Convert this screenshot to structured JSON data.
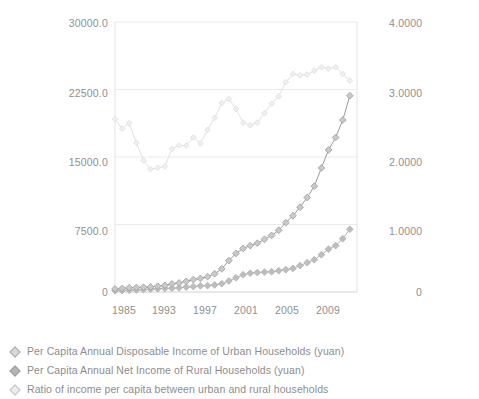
{
  "chart_data": {
    "type": "line",
    "title": "",
    "subtitle": "",
    "xlabel": "",
    "ylabel": "",
    "y2label": "",
    "grid": true,
    "legend_position": "bottom-left",
    "xlim": [
      1978,
      2012
    ],
    "ylim": [
      0,
      30000
    ],
    "y2lim": [
      0,
      4
    ],
    "x_tick_labels": [
      "1985",
      "1993",
      "1997",
      "2001",
      "2005",
      "2009"
    ],
    "x_tick_values": [
      1985,
      1993,
      1997,
      2001,
      2005,
      2009
    ],
    "y_tick_labels": [
      "30000.0",
      "22500.0",
      "15000.0",
      "7500.0",
      "0"
    ],
    "y_tick_values": [
      30000,
      22500,
      15000,
      7500,
      0
    ],
    "y2_tick_labels": [
      "4.0000",
      "3.0000",
      "2.0000",
      "1.0000",
      "0"
    ],
    "y2_tick_values": [
      4,
      3,
      2,
      1,
      0
    ],
    "x": [
      1978,
      1979,
      1980,
      1981,
      1982,
      1983,
      1984,
      1985,
      1986,
      1987,
      1988,
      1989,
      1990,
      1991,
      1992,
      1993,
      1994,
      1995,
      1996,
      1997,
      1998,
      1999,
      2000,
      2001,
      2002,
      2003,
      2004,
      2005,
      2006,
      2007,
      2008,
      2009,
      2010,
      2011
    ],
    "series": [
      {
        "name": "Per Capita Annual Disposable Income of Urban Households (yuan)",
        "axis": "left",
        "color": "#9a9a9a",
        "marker": "diamond",
        "values": [
          343,
          387,
          478,
          492,
          527,
          564,
          652,
          739,
          900,
          1002,
          1181,
          1376,
          1510,
          1701,
          2027,
          2577,
          3496,
          4283,
          4839,
          5160,
          5425,
          5854,
          6280,
          6860,
          7703,
          8472,
          9422,
          10493,
          11760,
          13786,
          15781,
          17175,
          19109,
          21810
        ]
      },
      {
        "name": "Per Capita Annual Net Income of Rural Households (yuan)",
        "axis": "left",
        "color": "#b0b0b0",
        "marker": "diamond",
        "values": [
          134,
          160,
          191,
          223,
          270,
          310,
          355,
          398,
          424,
          463,
          545,
          602,
          686,
          709,
          784,
          922,
          1221,
          1578,
          1926,
          2090,
          2162,
          2210,
          2253,
          2366,
          2476,
          2622,
          2936,
          3255,
          3587,
          4140,
          4761,
          5153,
          5919,
          6977
        ]
      },
      {
        "name": "Ratio of income per capita between urban and rural households",
        "axis": "right",
        "color": "#dcdcdc",
        "marker": "triangle",
        "values": [
          2.56,
          2.42,
          2.5,
          2.21,
          1.95,
          1.82,
          1.84,
          1.86,
          2.12,
          2.17,
          2.17,
          2.29,
          2.2,
          2.4,
          2.58,
          2.8,
          2.86,
          2.71,
          2.51,
          2.47,
          2.51,
          2.65,
          2.79,
          2.9,
          3.11,
          3.23,
          3.21,
          3.22,
          3.28,
          3.33,
          3.31,
          3.33,
          3.23,
          3.13
        ]
      }
    ]
  },
  "legend": {
    "items": [
      {
        "label": "Per Capita Annual Disposable Income of Urban Households (yuan)",
        "marker": "diamond-marker"
      },
      {
        "label": "Per Capita Annual Net Income of Rural Households (yuan)",
        "marker": "diamond-marker"
      },
      {
        "label": "Ratio of income per capita between urban and rural households",
        "marker": "diamond-marker"
      }
    ]
  },
  "axes": {
    "left_ticks": [
      "30000.0",
      "22500.0",
      "15000.0",
      "7500.0",
      "0"
    ],
    "right_ticks": [
      "4.0000",
      "3.0000",
      "2.0000",
      "1.0000",
      "0"
    ],
    "x_ticks": [
      "1985",
      "1993",
      "1997",
      "2001",
      "2005",
      "2009"
    ]
  }
}
